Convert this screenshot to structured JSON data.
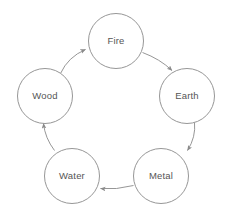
{
  "diagram": {
    "type": "cycle-diagram",
    "background_color": "#ffffff",
    "stroke_color": "#8a8a8a",
    "text_color": "#555555",
    "stroke_width": 0.9,
    "canvas": {
      "width": 232,
      "height": 216
    },
    "layout": {
      "center_x": 116,
      "center_y": 112,
      "ring_radius": 86,
      "node_radius": 27.5,
      "direction": "clockwise"
    },
    "nodes": [
      {
        "id": "fire",
        "label": "Fire",
        "cx": 116,
        "cy": 41,
        "r": 27.5
      },
      {
        "id": "earth",
        "label": "Earth",
        "cx": 187,
        "cy": 96,
        "r": 27.5
      },
      {
        "id": "metal",
        "label": "Metal",
        "cx": 161,
        "cy": 176,
        "r": 27.5
      },
      {
        "id": "water",
        "label": "Water",
        "cx": 72,
        "cy": 176,
        "r": 27.5
      },
      {
        "id": "wood",
        "label": "Wood",
        "cx": 45,
        "cy": 96,
        "r": 27.5
      }
    ],
    "edges": [
      {
        "id": "wood-to-fire",
        "from": "wood",
        "to": "fire",
        "path": "M 60.5 73.5 Q 68 57 85.5 49.5"
      },
      {
        "id": "fire-to-earth",
        "from": "fire",
        "to": "earth",
        "path": "M 142.5 52.5 Q 160 59 172 70.5"
      },
      {
        "id": "earth-to-metal",
        "from": "earth",
        "to": "metal",
        "path": "M 194.5 122.5 Q 196 137 187.5 150.5"
      },
      {
        "id": "metal-to-water",
        "from": "metal",
        "to": "water",
        "path": "M 133.5 185.5 Q 116 190 100.5 188.5"
      },
      {
        "id": "water-to-wood",
        "from": "water",
        "to": "wood",
        "path": "M 54.5 150.5 Q 45 138 43.5 123.5"
      }
    ]
  }
}
